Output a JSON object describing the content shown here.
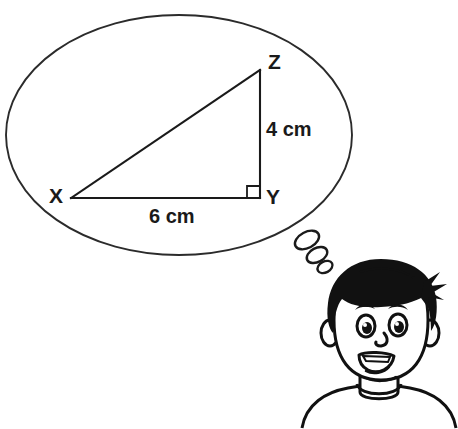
{
  "page": {
    "background_color": "#ffffff",
    "ink_color": "#111111",
    "width": 458,
    "height": 429
  },
  "thought_bubble": {
    "name": "thought-bubble",
    "shape": "ellipse",
    "center": {
      "x": 179,
      "y": 135
    },
    "radius": {
      "x": 173,
      "y": 120
    },
    "stroke_color": "#2b2b2b",
    "fill_color": "#ffffff",
    "tail_dots": [
      {
        "cx": 307,
        "cy": 240,
        "rx": 13,
        "ry": 8,
        "rotate": -28
      },
      {
        "cx": 317,
        "cy": 255,
        "rx": 11,
        "ry": 7,
        "rotate": -28
      },
      {
        "cx": 325,
        "cy": 267,
        "rx": 8,
        "ry": 5.5,
        "rotate": -28
      }
    ]
  },
  "diagram": {
    "name": "right-triangle-xyz",
    "type": "geometry-figure",
    "shape": "right triangle",
    "right_angle_at": "Y",
    "vertices": [
      {
        "id": "X",
        "label": "X",
        "x": 71,
        "y": 198,
        "label_x": 56,
        "label_y": 203
      },
      {
        "id": "Y",
        "label": "Y",
        "x": 260,
        "y": 198,
        "label_x": 266,
        "label_y": 204
      },
      {
        "id": "Z",
        "label": "Z",
        "x": 260,
        "y": 70,
        "label_x": 268,
        "label_y": 69
      }
    ],
    "sides": [
      {
        "id": "XY",
        "from": "X",
        "to": "Y",
        "measure": "6 cm",
        "value": 6,
        "unit": "cm",
        "label_x": 149,
        "label_y": 223
      },
      {
        "id": "YZ",
        "from": "Y",
        "to": "Z",
        "measure": "4 cm",
        "value": 4,
        "unit": "cm",
        "label_x": 266,
        "label_y": 136
      },
      {
        "id": "XZ",
        "from": "X",
        "to": "Z",
        "measure": "",
        "value": null,
        "unit": "",
        "label_x": 0,
        "label_y": 0
      }
    ],
    "right_angle_marker": {
      "x": 247,
      "y": 185,
      "size": 12
    }
  },
  "character": {
    "name": "boy-head",
    "description": "cartoon boy head thinking",
    "hair_color": "#111111",
    "face_color": "#ffffff",
    "features": {
      "left_eye": {
        "cx": 366,
        "cy": 326
      },
      "right_eye": {
        "cx": 398,
        "cy": 325
      },
      "nose": {
        "cx": 382,
        "cy": 342
      },
      "mouth": {
        "cx": 377,
        "cy": 361
      }
    }
  }
}
